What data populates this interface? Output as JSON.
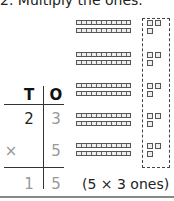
{
  "heading": "2. Multiply the ones.",
  "place_value_chart": {
    "headers": {
      "tens": "T",
      "ones": "O"
    },
    "multiplicand": {
      "tens": "2",
      "ones": "3"
    },
    "operator": "×",
    "multiplier": {
      "ones": "5"
    },
    "result": {
      "tens": "1",
      "ones": "5"
    }
  },
  "annotation": "(5 × 3 ones)",
  "base_ten_model": {
    "groups": 5,
    "tens_rods_per_group": 2,
    "ones_cubes_per_group": 3,
    "ones_highlighted": "dashed box around all ones cubes"
  }
}
